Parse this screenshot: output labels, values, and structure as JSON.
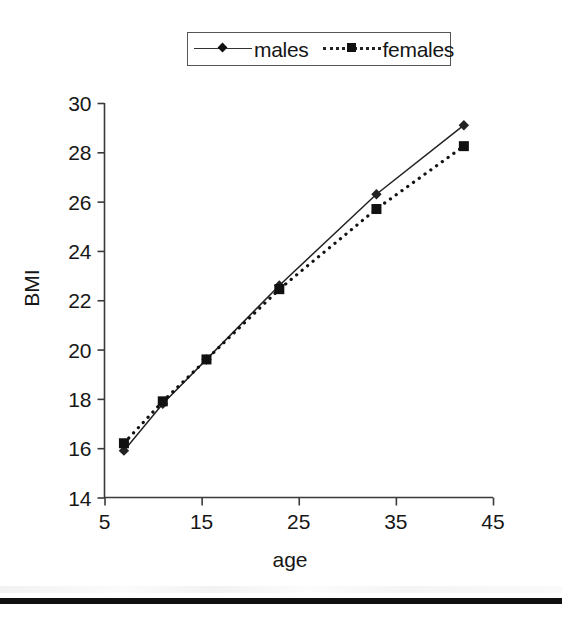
{
  "chart_data": {
    "type": "line",
    "title": "",
    "xlabel": "age",
    "ylabel": "BMI",
    "xlim": [
      5,
      45
    ],
    "ylim": [
      14,
      30
    ],
    "xticks": [
      5,
      15,
      25,
      35,
      45
    ],
    "yticks": [
      14,
      16,
      18,
      20,
      22,
      24,
      26,
      28,
      30
    ],
    "grid": false,
    "legend_position": "top-center",
    "x": [
      7,
      11,
      15.5,
      23,
      33,
      42
    ],
    "series": [
      {
        "name": "males",
        "values": [
          15.9,
          17.8,
          19.6,
          22.6,
          26.3,
          29.1
        ],
        "line_style": "solid",
        "marker": "diamond",
        "color": "#222222"
      },
      {
        "name": "females",
        "values": [
          16.2,
          17.9,
          19.6,
          22.45,
          25.7,
          28.25
        ],
        "line_style": "dotted",
        "marker": "square",
        "color": "#111111"
      }
    ]
  },
  "legend": {
    "entries": [
      {
        "label": "males",
        "marker": "diamond-marker",
        "line": "solid-line"
      },
      {
        "label": "females",
        "marker": "square-marker",
        "line": "dotted-line"
      }
    ]
  },
  "axes": {
    "y_title": "BMI",
    "x_title": "age",
    "y_tick_labels": [
      "30",
      "28",
      "26",
      "24",
      "22",
      "20",
      "18",
      "16",
      "14"
    ],
    "x_tick_labels": [
      "5",
      "15",
      "25",
      "35",
      "45"
    ]
  },
  "colors": {
    "axis": "#3a3a3a",
    "males": "#222222",
    "females": "#111111",
    "text": "#171717",
    "page_rule": "#111111",
    "background": "#ffffff"
  }
}
